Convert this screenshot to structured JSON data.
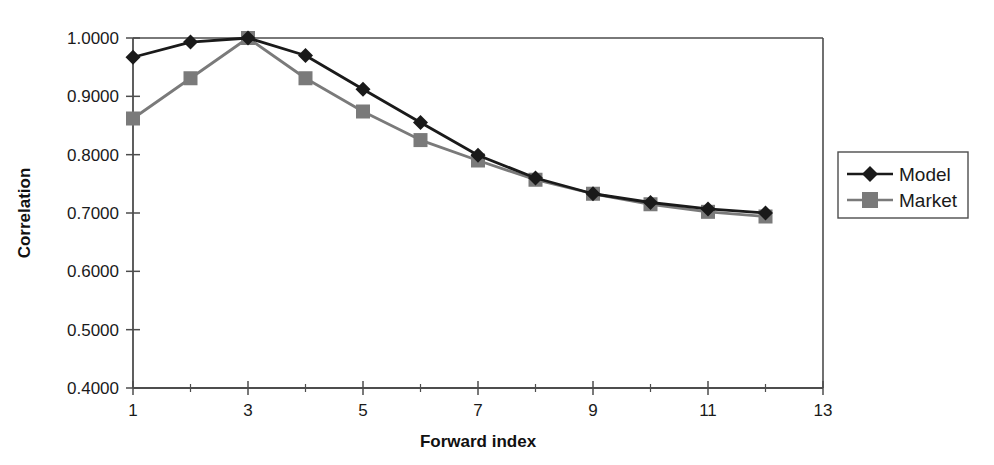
{
  "chart_data": {
    "type": "line",
    "title": "",
    "xlabel": "Forward index",
    "ylabel": "Correlation",
    "x": [
      1,
      2,
      3,
      4,
      5,
      6,
      7,
      8,
      9,
      10,
      11,
      12
    ],
    "xlim": [
      1,
      13
    ],
    "ylim": [
      0.4,
      1.0
    ],
    "xticks": [
      1,
      3,
      5,
      7,
      9,
      11,
      13
    ],
    "xtick_labels": [
      "1",
      "3",
      "5",
      "7",
      "9",
      "11",
      "13"
    ],
    "xtick_minor": [
      2,
      4,
      6,
      8,
      10,
      12
    ],
    "yticks": [
      0.4,
      0.5,
      0.6,
      0.7,
      0.8,
      0.9,
      1.0
    ],
    "ytick_labels": [
      "0.4000",
      "0.5000",
      "0.6000",
      "0.7000",
      "0.8000",
      "0.9000",
      "1.0000"
    ],
    "grid": false,
    "legend_position": "right",
    "series": [
      {
        "name": "Model",
        "marker": "diamond",
        "color": "#1a1a1a",
        "values": [
          0.967,
          0.993,
          1.0,
          0.97,
          0.912,
          0.855,
          0.799,
          0.76,
          0.733,
          0.718,
          0.707,
          0.7
        ]
      },
      {
        "name": "Market",
        "marker": "square",
        "color": "#7a7a7a",
        "values": [
          0.862,
          0.931,
          1.0,
          0.931,
          0.874,
          0.825,
          0.79,
          0.757,
          0.733,
          0.715,
          0.702,
          0.694
        ]
      }
    ]
  },
  "axes": {
    "y_title": "Correlation",
    "x_title": "Forward index"
  },
  "legend": {
    "entries": [
      {
        "label": "Model"
      },
      {
        "label": "Market"
      }
    ]
  },
  "colors": {
    "model": "#1a1a1a",
    "market": "#7a7a7a",
    "axis": "#4d4d4d",
    "background": "#ffffff"
  }
}
